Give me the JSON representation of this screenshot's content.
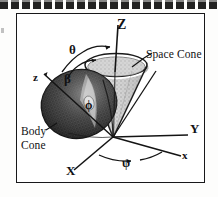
{
  "figure": {
    "caption_rule": "dashed-scan-line",
    "border_color": "#18181a",
    "background_color": "#ffffff"
  },
  "labels": {
    "axis_Z": "Z",
    "axis_z_body": "z",
    "axis_Y": "Y",
    "axis_X": "X",
    "axis_x_body": "x",
    "angle_theta": "θ",
    "angle_beta": "β",
    "angle_phi": "ϕ",
    "angle_psi": "ψ",
    "space_cone": "Space Cone",
    "body_cone_line1": "Body",
    "body_cone_line2": "Cone"
  },
  "colors": {
    "ink": "#121214",
    "space_cone_fill": "#bdbdbd",
    "body_cone_fill": "#575757",
    "paper": "#ffffff"
  }
}
